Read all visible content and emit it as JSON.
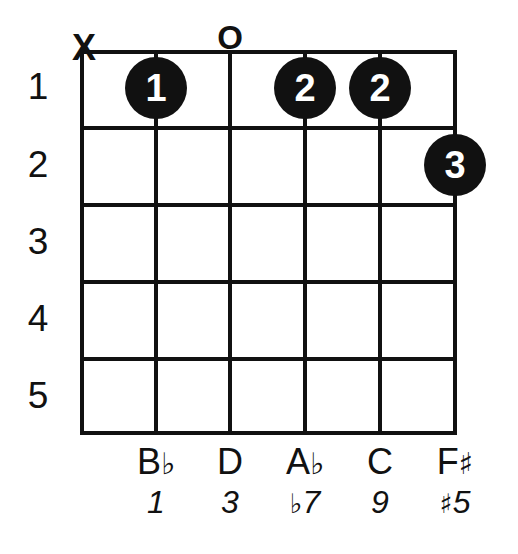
{
  "diagram": {
    "type": "guitar-chord-diagram",
    "instrument": "guitar",
    "string_count": 6,
    "fret_count": 5,
    "starting_fret": 1,
    "ink_color": "#111111",
    "background_color": "#ffffff",
    "fret_numbers": [
      "1",
      "2",
      "3",
      "4",
      "5"
    ],
    "top_markers": [
      {
        "string": 1,
        "symbol": "X",
        "meaning": "muted"
      },
      {
        "string": 3,
        "symbol": "O",
        "meaning": "open"
      }
    ],
    "finger_dots": [
      {
        "string": 2,
        "fret": 1,
        "finger": "1"
      },
      {
        "string": 4,
        "fret": 1,
        "finger": "2"
      },
      {
        "string": 5,
        "fret": 1,
        "finger": "2"
      },
      {
        "string": 6,
        "fret": 2,
        "finger": "3"
      }
    ],
    "note_row": [
      {
        "string": 2,
        "letter": "B",
        "accidental": "♭",
        "text": "B♭"
      },
      {
        "string": 3,
        "letter": "D",
        "accidental": "",
        "text": "D"
      },
      {
        "string": 4,
        "letter": "A",
        "accidental": "♭",
        "text": "A♭"
      },
      {
        "string": 5,
        "letter": "C",
        "accidental": "",
        "text": "C"
      },
      {
        "string": 6,
        "letter": "F",
        "accidental": "♯",
        "text": "F♯"
      }
    ],
    "interval_row": [
      {
        "string": 2,
        "prefix": "",
        "degree": "1",
        "text": "1"
      },
      {
        "string": 3,
        "prefix": "",
        "degree": "3",
        "text": "3"
      },
      {
        "string": 4,
        "prefix": "♭",
        "degree": "7",
        "text": "♭7"
      },
      {
        "string": 5,
        "prefix": "",
        "degree": "9",
        "text": "9"
      },
      {
        "string": 6,
        "prefix": "♯",
        "degree": "5",
        "text": "♯5"
      }
    ]
  }
}
